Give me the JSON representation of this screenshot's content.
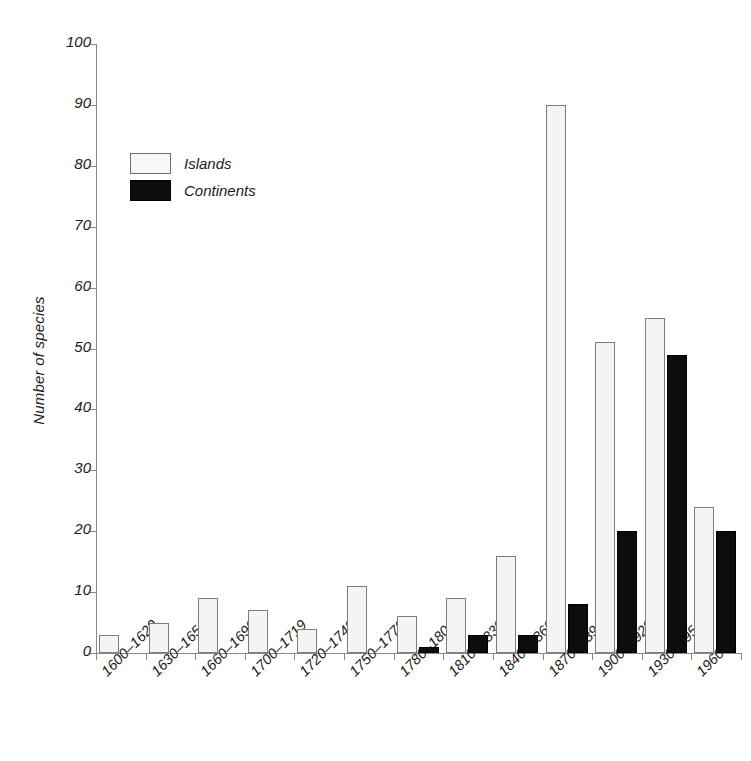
{
  "chart_data": {
    "type": "bar",
    "title": "",
    "xlabel": "",
    "ylabel": "Number of species",
    "ylim": [
      0,
      100
    ],
    "ytick_step": 10,
    "yticks": [
      0,
      10,
      20,
      30,
      40,
      50,
      60,
      70,
      80,
      90,
      100
    ],
    "grid": false,
    "legend_position": "upper-left-inside",
    "categories": [
      "1600–1629",
      "1630–1659",
      "1660–1699",
      "1700–1719",
      "1720–1749",
      "1750–1779",
      "1780–1809",
      "1810–1839",
      "1840–1869",
      "1870–1899",
      "1900–1929",
      "1930–1959",
      "1960–"
    ],
    "series": [
      {
        "name": "Islands",
        "color": "#f4f4f4",
        "edge_color": "#7d7d7d",
        "values": [
          3,
          5,
          9,
          7,
          4,
          11,
          6,
          9,
          16,
          90,
          51,
          55,
          24
        ]
      },
      {
        "name": "Continents",
        "color": "#0d0d0d",
        "edge_color": "#000000",
        "values": [
          0,
          0,
          0,
          0,
          0,
          0,
          1,
          3,
          3,
          8,
          20,
          49,
          20
        ]
      }
    ]
  },
  "axis": {
    "y_title": "Number of species"
  },
  "legend": {
    "items": [
      {
        "label": "Islands"
      },
      {
        "label": "Continents"
      }
    ]
  }
}
